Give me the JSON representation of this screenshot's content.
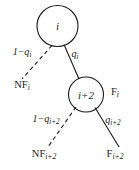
{
  "figure": {
    "type": "probability-tree-diagram",
    "background_color": "#ffffff",
    "stroke_color": "#1a1a1a"
  },
  "nodes": {
    "root": {
      "label": "i",
      "cx": 57.5,
      "cy": 26,
      "r": 20.5
    },
    "child": {
      "label": "i+2",
      "cx": 86,
      "cy": 94.5,
      "r": 17.5
    }
  },
  "node_side_labels": {
    "child_right": "F",
    "child_right_sub": "i"
  },
  "edges": [
    {
      "name": "root-to-nf",
      "style": "dashed",
      "label_main": "1−q",
      "label_sub": "i",
      "label_x": 22,
      "label_y": 53
    },
    {
      "name": "root-to-child",
      "style": "solid",
      "label_main": "q",
      "label_sub": "i",
      "label_x": 75,
      "label_y": 55
    },
    {
      "name": "child-to-nf",
      "style": "dashed",
      "label_main": "1−q",
      "label_sub": "i+2",
      "label_x": 46,
      "label_y": 120
    },
    {
      "name": "child-to-f",
      "style": "solid",
      "label_main": "q",
      "label_sub": "i+2",
      "label_x": 113,
      "label_y": 121
    }
  ],
  "leaves": [
    {
      "name": "leaf-nf-i",
      "main": "NF",
      "sub": "i",
      "x": 22,
      "y": 86
    },
    {
      "name": "leaf-nf-i2",
      "main": "NF",
      "sub": "i+2",
      "x": 44,
      "y": 155
    },
    {
      "name": "leaf-f-i2",
      "main": "F",
      "sub": "i+2",
      "x": 115,
      "y": 155
    }
  ]
}
